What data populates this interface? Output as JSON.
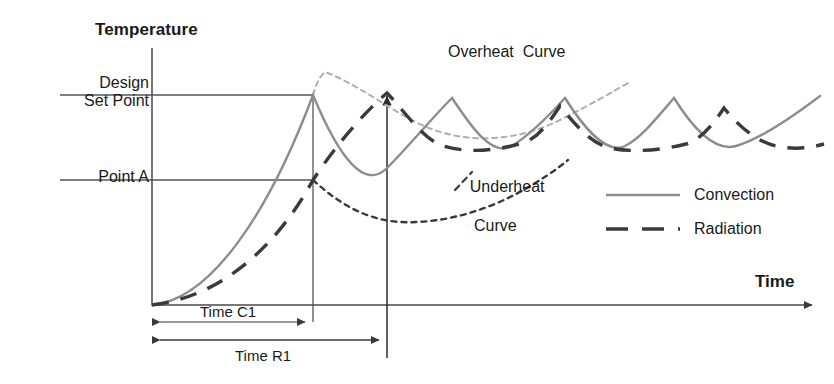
{
  "figure": {
    "kind": "line-diagram",
    "background": "#ffffff"
  },
  "axes": {
    "y_title": "Temperature",
    "x_title": "Time",
    "origin": {
      "x": 152,
      "y": 305
    },
    "y_axis_top": {
      "x": 152,
      "y": 48
    },
    "x_axis_end": {
      "x": 820,
      "y": 305
    }
  },
  "reference_levels": [
    {
      "name": "design-set-point",
      "label": "Design\nSet Point",
      "y": 95,
      "line_from_x": 60,
      "line_to_x": 313
    },
    {
      "name": "point-a",
      "label": "Point A",
      "y": 180,
      "line_from_x": 60,
      "line_to_x": 313
    }
  ],
  "vertical_markers": [
    {
      "name": "time-c1-marker",
      "x": 313,
      "from_y": 95,
      "to_y": 322,
      "arrowhead": false
    },
    {
      "name": "time-r1-marker",
      "x": 387,
      "from_y": 93,
      "to_y": 358,
      "arrowhead": true
    }
  ],
  "dimensions": [
    {
      "name": "time-c1",
      "label": "Time C1",
      "from_x": 152,
      "to_x": 313,
      "y": 322,
      "label_position": "above"
    },
    {
      "name": "time-r1",
      "label": "Time R1",
      "from_x": 152,
      "to_x": 387,
      "y": 340,
      "label_position": "below"
    }
  ],
  "annotations": [
    {
      "name": "overheat-curve",
      "label": "Overheat  Curve",
      "x": 448,
      "y": 43
    },
    {
      "name": "underheat-curve",
      "line1": "Underheat",
      "line2": "Curve",
      "x": 452,
      "y": 157
    }
  ],
  "legend": {
    "position": "center-right",
    "items": [
      {
        "name": "convection",
        "label": "Convection",
        "style": "solid",
        "color": "#8d8d8d"
      },
      {
        "name": "radiation",
        "label": "Radiation",
        "style": "dashed",
        "color": "#3a3a3a"
      }
    ]
  },
  "colors": {
    "convection": "#8d8d8d",
    "radiation": "#3a3a3a",
    "overheat": "#b0b0b0",
    "underheat": "#3a3a3a",
    "axis": "#4a4a4a",
    "guide": "#555555",
    "text": "#1a1a1a"
  },
  "chart_data": {
    "type": "line",
    "title": "",
    "xlabel": "Time",
    "ylabel": "Temperature",
    "grid": false,
    "legend_position": "center-right",
    "y_reference_lines": [
      {
        "label": "Design Set Point",
        "pixel_y": 95
      },
      {
        "label": "Point A",
        "pixel_y": 180
      }
    ],
    "x_reference_marks": [
      {
        "label": "Time C1",
        "pixel_x": 313
      },
      {
        "label": "Time R1",
        "pixel_x": 387
      }
    ],
    "series": [
      {
        "name": "Convection",
        "style": "solid",
        "color": "#8d8d8d",
        "note": "rises exponentially from origin to Design Set Point at Time C1, then oscillates in a damped saw/cusp pattern about the set point",
        "path": "M152,305 C210,300 268,215 313,95 C340,160 365,190 387,168 C410,145 430,120 452,98 C470,125 492,158 512,146 C528,136 545,120 565,98 C584,128 606,155 625,146 C641,138 655,120 674,98 C694,130 715,152 736,146 C760,139 795,115 820,96"
      },
      {
        "name": "Radiation",
        "style": "dashed",
        "color": "#3a3a3a",
        "note": "rises more slowly, crossing Point A at Time C1 and reaching its peak at Time R1, then oscillates with a phase lag behind the convection curve",
        "path": "M152,305 C214,298 272,255 313,180 C338,142 365,112 387,93 C405,112 424,140 443,146 C470,154 498,150 523,143 C538,138 548,124 560,106 C576,126 592,144 610,148 C634,153 662,150 686,144 C700,140 712,126 724,108 C740,128 758,142 776,146 C795,150 810,148 824,144"
      },
      {
        "name": "Overheat Curve",
        "style": "dotted",
        "color": "#b0b0b0",
        "note": "light dotted branch leaving the Design Set Point upward at Time C1, dipping and recovering toward the right",
        "path": "M313,95 C316,84 320,76 325,72 C360,85 392,112 424,126 C470,146 520,140 560,120 C590,105 612,92 630,82"
      },
      {
        "name": "Underheat Curve",
        "style": "dotted",
        "color": "#3a3a3a",
        "note": "dark dotted branch leaving Point A at Time C1, sagging to a minimum then rising back toward the oscillating band",
        "path": "M313,180 C340,205 368,220 400,222 C440,224 482,212 516,194 C540,181 556,170 568,160"
      }
    ]
  }
}
